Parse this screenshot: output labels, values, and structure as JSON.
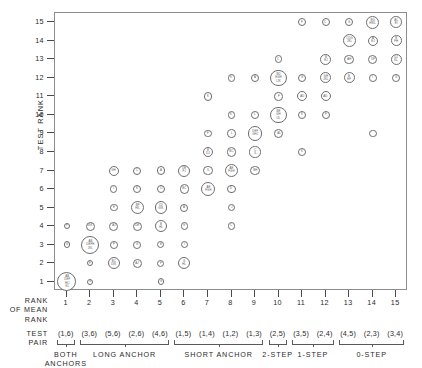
{
  "axes": {
    "y_title": "TEST RANK",
    "y_ticks": [
      1,
      2,
      3,
      4,
      5,
      6,
      7,
      8,
      9,
      10,
      11,
      12,
      13,
      14,
      15
    ],
    "x_ticks": [
      1,
      2,
      3,
      4,
      5,
      6,
      7,
      8,
      9,
      10,
      11,
      12,
      13,
      14,
      15
    ],
    "x_block_label_rank": "RANK\nOF MEAN\nRANK",
    "x_block_label_pair": "TEST\nPAIR"
  },
  "test_pairs": [
    "(1,6)",
    "(3,6)",
    "(5,6)",
    "(2,6)",
    "(4,6)",
    "(1,5)",
    "(1,4)",
    "(1,2)",
    "(1,3)",
    "(2,5)",
    "(3,5)",
    "(2,4)",
    "(4,5)",
    "(2,3)",
    "(3,4)"
  ],
  "groups": [
    {
      "label": "BOTH\nANCHORS",
      "start": 1,
      "end": 1
    },
    {
      "label": "LONG ANCHOR",
      "start": 2,
      "end": 5
    },
    {
      "label": "SHORT ANCHOR",
      "start": 6,
      "end": 9
    },
    {
      "label": "2-STEP",
      "start": 10,
      "end": 10
    },
    {
      "label": "1-STEP",
      "start": 11,
      "end": 12
    },
    {
      "label": "0-STEP",
      "start": 13,
      "end": 15
    }
  ],
  "chart_data": {
    "type": "scatter",
    "title": "",
    "xlabel": "RANK OF MEAN RANK",
    "ylabel": "TEST RANK",
    "xlim": [
      0.5,
      15.5
    ],
    "ylim": [
      0.5,
      15.5
    ],
    "grid": false,
    "legend": "none",
    "note": "Each plotted circle is a cluster marker; radius grows with the number of subject letters listed inside it. Labels are subject-code letters.",
    "points": [
      {
        "x": 1,
        "y": 4,
        "r": 3.2,
        "label": "F"
      },
      {
        "x": 1,
        "y": 3,
        "r": 3.2,
        "label": "G"
      },
      {
        "x": 1,
        "y": 1,
        "r": 9.5,
        "label": "AB\nDEF\nHIJ\nKL"
      },
      {
        "x": 2,
        "y": 4,
        "r": 4.6,
        "label": "GIK"
      },
      {
        "x": 2,
        "y": 3,
        "r": 9.0,
        "label": "AB\nDEFH\nJKL"
      },
      {
        "x": 2,
        "y": 2,
        "r": 3.2,
        "label": "F"
      },
      {
        "x": 2,
        "y": 1,
        "r": 3.2,
        "label": "G"
      },
      {
        "x": 3,
        "y": 7,
        "r": 5.0,
        "label": "GH"
      },
      {
        "x": 3,
        "y": 6,
        "r": 3.6,
        "label": "I"
      },
      {
        "x": 3,
        "y": 5,
        "r": 3.9,
        "label": "E"
      },
      {
        "x": 3,
        "y": 4,
        "r": 4.4,
        "label": "AJ"
      },
      {
        "x": 3,
        "y": 3,
        "r": 3.9,
        "label": "F"
      },
      {
        "x": 3,
        "y": 2,
        "r": 6.3,
        "label": "BC\nDIK"
      },
      {
        "x": 4,
        "y": 7,
        "r": 4.0,
        "label": "C"
      },
      {
        "x": 4,
        "y": 6,
        "r": 4.0,
        "label": "K"
      },
      {
        "x": 4,
        "y": 5,
        "r": 6.6,
        "label": "BF\nHIL"
      },
      {
        "x": 4,
        "y": 4,
        "r": 4.6,
        "label": "DE"
      },
      {
        "x": 4,
        "y": 3,
        "r": 3.9,
        "label": "G"
      },
      {
        "x": 4,
        "y": 2,
        "r": 4.4,
        "label": "AJ"
      },
      {
        "x": 5,
        "y": 7,
        "r": 4.2,
        "label": "A"
      },
      {
        "x": 5,
        "y": 6,
        "r": 4.2,
        "label": "IJ"
      },
      {
        "x": 5,
        "y": 5,
        "r": 6.2,
        "label": "CD\nGIK"
      },
      {
        "x": 5,
        "y": 4,
        "r": 6.0,
        "label": "B\nHL"
      },
      {
        "x": 5,
        "y": 3,
        "r": 3.6,
        "label": "E"
      },
      {
        "x": 5,
        "y": 2,
        "r": 3.6,
        "label": "F"
      },
      {
        "x": 5,
        "y": 1,
        "r": 3.4,
        "label": "G"
      },
      {
        "x": 6,
        "y": 7,
        "r": 6.0,
        "label": "DE\nFJ"
      },
      {
        "x": 6,
        "y": 6,
        "r": 4.6,
        "label": "BC"
      },
      {
        "x": 6,
        "y": 5,
        "r": 4.0,
        "label": "A"
      },
      {
        "x": 6,
        "y": 4,
        "r": 3.9,
        "label": "G"
      },
      {
        "x": 6,
        "y": 3,
        "r": 3.6,
        "label": "I"
      },
      {
        "x": 6,
        "y": 2,
        "r": 6.0,
        "label": "G\nHL"
      },
      {
        "x": 7,
        "y": 11,
        "r": 4.2,
        "label": "K"
      },
      {
        "x": 7,
        "y": 9,
        "r": 3.9,
        "label": "F"
      },
      {
        "x": 7,
        "y": 8,
        "r": 5.4,
        "label": "B\nDJ"
      },
      {
        "x": 7,
        "y": 7,
        "r": 4.6,
        "label": "IL"
      },
      {
        "x": 7,
        "y": 6,
        "r": 7.0,
        "label": "AE\nFGH"
      },
      {
        "x": 8,
        "y": 12,
        "r": 3.9,
        "label": "K"
      },
      {
        "x": 8,
        "y": 10,
        "r": 3.9,
        "label": "K"
      },
      {
        "x": 8,
        "y": 9,
        "r": 4.2,
        "label": "L"
      },
      {
        "x": 8,
        "y": 8,
        "r": 4.6,
        "label": "BC"
      },
      {
        "x": 8,
        "y": 7,
        "r": 6.8,
        "label": "AE\nFGH"
      },
      {
        "x": 8,
        "y": 6,
        "r": 4.2,
        "label": "D"
      },
      {
        "x": 8,
        "y": 5,
        "r": 3.9,
        "label": "J"
      },
      {
        "x": 8,
        "y": 4,
        "r": 3.9,
        "label": "C"
      },
      {
        "x": 9,
        "y": 12,
        "r": 4.2,
        "label": "A"
      },
      {
        "x": 9,
        "y": 10,
        "r": 3.9,
        "label": "L"
      },
      {
        "x": 9,
        "y": 9,
        "r": 7.2,
        "label": "DEF\nGHJ"
      },
      {
        "x": 9,
        "y": 8,
        "r": 5.6,
        "label": "C\nIL"
      },
      {
        "x": 9,
        "y": 7,
        "r": 4.6,
        "label": "BH"
      },
      {
        "x": 10,
        "y": 13,
        "r": 3.9,
        "label": "C"
      },
      {
        "x": 10,
        "y": 12,
        "r": 8.2,
        "label": "BD\nEGH\nIJK"
      },
      {
        "x": 10,
        "y": 11,
        "r": 4.2,
        "label": "F"
      },
      {
        "x": 10,
        "y": 10,
        "r": 8.4,
        "label": "BE\nGH\nIJL"
      },
      {
        "x": 10,
        "y": 9,
        "r": 4.4,
        "label": "AL"
      },
      {
        "x": 11,
        "y": 15,
        "r": 4.0,
        "label": "F"
      },
      {
        "x": 11,
        "y": 12,
        "r": 4.0,
        "label": "G"
      },
      {
        "x": 11,
        "y": 11,
        "r": 5.0,
        "label": "AD"
      },
      {
        "x": 11,
        "y": 10,
        "r": 4.2,
        "label": "K"
      },
      {
        "x": 11,
        "y": 8,
        "r": 3.9,
        "label": "K"
      },
      {
        "x": 12,
        "y": 15,
        "r": 4.0,
        "label": "C"
      },
      {
        "x": 12,
        "y": 13,
        "r": 5.8,
        "label": "B\nEJ"
      },
      {
        "x": 12,
        "y": 12,
        "r": 5.6,
        "label": "GH\nJKL"
      },
      {
        "x": 12,
        "y": 11,
        "r": 5.0,
        "label": "AD"
      },
      {
        "x": 12,
        "y": 10,
        "r": 4.0,
        "label": "F"
      },
      {
        "x": 13,
        "y": 15,
        "r": 4.2,
        "label": "G"
      },
      {
        "x": 13,
        "y": 14,
        "r": 6.4,
        "label": "CDG\nJKL"
      },
      {
        "x": 13,
        "y": 13,
        "r": 4.8,
        "label": "AH"
      },
      {
        "x": 13,
        "y": 12,
        "r": 5.6,
        "label": "B\nEF"
      },
      {
        "x": 14,
        "y": 15,
        "r": 6.4,
        "label": "BG\nHIKL"
      },
      {
        "x": 14,
        "y": 14,
        "r": 5.2,
        "label": "A\nEJ"
      },
      {
        "x": 14,
        "y": 13,
        "r": 4.8,
        "label": "DF"
      },
      {
        "x": 14,
        "y": 12,
        "r": 3.9,
        "label": "I"
      },
      {
        "x": 14,
        "y": 9,
        "r": 3.9,
        "label": ""
      },
      {
        "x": 15,
        "y": 15,
        "r": 5.8,
        "label": "AC\nEI"
      },
      {
        "x": 15,
        "y": 14,
        "r": 5.4,
        "label": "B\nFH"
      },
      {
        "x": 15,
        "y": 13,
        "r": 5.6,
        "label": "DJ\nKL"
      },
      {
        "x": 15,
        "y": 12,
        "r": 3.9,
        "label": "G"
      }
    ]
  }
}
